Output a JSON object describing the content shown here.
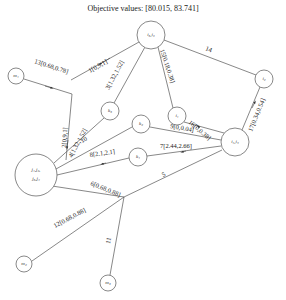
{
  "title": "Objective values: [80.015, 83.741]",
  "nodes": [
    {
      "id": "i3i6",
      "label": "i₃,i₆",
      "x": 151,
      "y": 35,
      "r": 14
    },
    {
      "id": "m1",
      "label": "m₁",
      "x": 16,
      "y": 76,
      "r": 8
    },
    {
      "id": "k3",
      "label": "k₃",
      "x": 110,
      "y": 111,
      "r": 9
    },
    {
      "id": "i1",
      "label": "i₁",
      "x": 177,
      "y": 116,
      "r": 9
    },
    {
      "id": "i2",
      "label": "i₂",
      "x": 264,
      "y": 79,
      "r": 9
    },
    {
      "id": "k2",
      "label": "k₂",
      "x": 141,
      "y": 124,
      "r": 9
    },
    {
      "id": "J",
      "label1": "j₁,j₂,",
      "label2": "j₃,j₄",
      "x": 36,
      "y": 175,
      "r": 21
    },
    {
      "id": "k1",
      "label": "k₁",
      "x": 138,
      "y": 157,
      "r": 9
    },
    {
      "id": "i4i5",
      "label": "i₄,i₅",
      "x": 235,
      "y": 142,
      "r": 14
    },
    {
      "id": "m2",
      "label": "m₂",
      "x": 24,
      "y": 264,
      "r": 8
    },
    {
      "id": "m3",
      "label": "m₃",
      "x": 108,
      "y": 283,
      "r": 8
    }
  ],
  "edges": [
    {
      "id": "e1",
      "label": "1[0,9,1]"
    },
    {
      "id": "e2",
      "label": "2[0,9,1]"
    },
    {
      "id": "e3",
      "label": "3[1.32,1.52]"
    },
    {
      "id": "e4",
      "label": "4[1.32,1.52]"
    },
    {
      "id": "e5",
      "label": "5"
    },
    {
      "id": "e6",
      "label": "6[0.68,0.88]"
    },
    {
      "id": "e7",
      "label": "7[2.44,2.66]"
    },
    {
      "id": "e8",
      "label": "8[2.1,2.1]"
    },
    {
      "id": "e9",
      "label": "9[0,0.04]"
    },
    {
      "id": "e10",
      "label": "10"
    },
    {
      "id": "e11",
      "label": "11"
    },
    {
      "id": "e12",
      "label": "12[0.68,0.88]"
    },
    {
      "id": "e13",
      "label": "13[0.68,0.78]"
    },
    {
      "id": "e14",
      "label": "14"
    },
    {
      "id": "e15",
      "label": "15[0.18,0.38]"
    },
    {
      "id": "e16",
      "label": "16[0,0.38]"
    },
    {
      "id": "e17",
      "label": "17[0.34,0.54]"
    }
  ]
}
